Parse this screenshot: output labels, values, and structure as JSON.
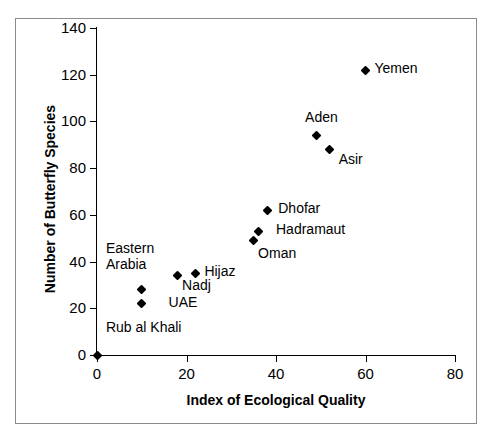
{
  "chart_data": {
    "type": "scatter",
    "title": "",
    "xlabel": "Index of Ecological Quality",
    "ylabel": "Number of Butterfly Species",
    "xlim": [
      0,
      80
    ],
    "ylim": [
      0,
      140
    ],
    "xticks": [
      0,
      20,
      40,
      60,
      80
    ],
    "yticks": [
      0,
      20,
      40,
      60,
      80,
      100,
      120,
      140
    ],
    "grid": false,
    "legend": "none",
    "marker_color": "#000000",
    "points": [
      {
        "label": "Rub al Khali",
        "x": 0,
        "y": 0
      },
      {
        "label": "UAE",
        "x": 10,
        "y": 22
      },
      {
        "label": "Eastern\nArabia",
        "x": 10,
        "y": 28
      },
      {
        "label": "Nadj",
        "x": 18,
        "y": 34
      },
      {
        "label": "Hijaz",
        "x": 22,
        "y": 35
      },
      {
        "label": "Oman",
        "x": 35,
        "y": 49
      },
      {
        "label": "Hadramaut",
        "x": 36,
        "y": 53
      },
      {
        "label": "Dhofar",
        "x": 38,
        "y": 62
      },
      {
        "label": "Asir",
        "x": 52,
        "y": 88
      },
      {
        "label": "Aden",
        "x": 49,
        "y": 94
      },
      {
        "label": "Yemen",
        "x": 60,
        "y": 122
      }
    ],
    "annotations": [
      {
        "text": "Rub al Khali",
        "x": 2,
        "y": 11
      },
      {
        "text": "Eastern",
        "x": 2,
        "y": 45
      },
      {
        "text": "Arabia",
        "x": 2,
        "y": 38
      },
      {
        "text": "UAE",
        "x": 16,
        "y": 22
      },
      {
        "text": "Nadj",
        "x": 19,
        "y": 29
      },
      {
        "text": "Hijaz",
        "x": 24,
        "y": 35
      },
      {
        "text": "Oman",
        "x": 36,
        "y": 43
      },
      {
        "text": "Hadramaut",
        "x": 40,
        "y": 53
      },
      {
        "text": "Dhofar",
        "x": 40.5,
        "y": 62
      },
      {
        "text": "Asir",
        "x": 54,
        "y": 83
      },
      {
        "text": "Aden",
        "x": 46.5,
        "y": 101
      },
      {
        "text": "Yemen",
        "x": 62,
        "y": 122
      }
    ]
  }
}
